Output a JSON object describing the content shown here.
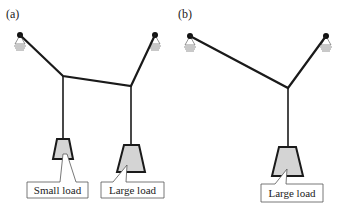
{
  "figure": {
    "panels": [
      {
        "id": "a",
        "label": "(a)",
        "loads": [
          {
            "label": "Small load",
            "size": "small"
          },
          {
            "label": "Large load",
            "size": "large"
          }
        ]
      },
      {
        "id": "b",
        "label": "(b)",
        "loads": [
          {
            "label": "Large load",
            "size": "large"
          }
        ]
      }
    ]
  },
  "colors": {
    "line": "#1a1a1a",
    "load_fill": "#d4d4d4",
    "background": "#ffffff"
  }
}
